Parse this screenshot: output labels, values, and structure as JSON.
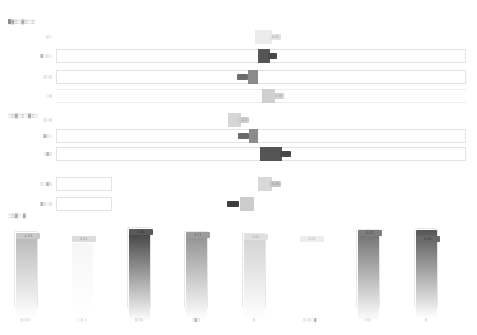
{
  "sections": [
    {
      "id": "section-1",
      "title": "█▓▒░▓▒░▒",
      "x": 8,
      "y": 19
    },
    {
      "id": "section-2",
      "title": "░▒▓░▒░▓▒░",
      "x": 8,
      "y": 113
    },
    {
      "id": "section-3",
      "title": "░▒▓░ ▓",
      "x": 8,
      "y": 213
    }
  ],
  "slider_rows": [
    {
      "label": "▒░",
      "value": "0.05",
      "track": "none",
      "handle_left": 255,
      "handle_width": 17,
      "handle_color": "#ececec",
      "badge_text_color": "#9a9a9a",
      "badge_bg": "#e4e4e4",
      "badge_side": "right",
      "y": 30
    },
    {
      "label": "▓░▒░",
      "value": "0.3",
      "track": "bordered",
      "handle_left": 258,
      "handle_width": 12,
      "handle_color": "#555555",
      "badge_text_color": "#3b3b3b",
      "badge_bg": "#4b4b4b",
      "badge_side": "right",
      "y": 49
    },
    {
      "label": "▒░▒",
      "value": "-0.1",
      "track": "bordered",
      "handle_left": 248,
      "handle_width": 10,
      "handle_color": "#8a8a8a",
      "badge_text_color": "#5d5d5d",
      "badge_bg": "#6f6f6f",
      "badge_side": "left",
      "y": 70
    },
    {
      "label": "░▒",
      "value": "0.08",
      "track": "hairline",
      "handle_left": 262,
      "handle_width": 13,
      "handle_color": "#cfcfcf",
      "badge_text_color": "#a6a6a6",
      "badge_bg": "#d4d4d4",
      "badge_side": "right",
      "y": 89
    },
    {
      "label": "▒░▒",
      "value": "-0.1",
      "track": "none",
      "handle_left": 228,
      "handle_width": 13,
      "handle_color": "#d6d6d6",
      "badge_text_color": "#9c9c9c",
      "badge_bg": "#cdcdcd",
      "badge_side": "right",
      "y": 113
    },
    {
      "label": "▓▒░",
      "value": "-0.2",
      "track": "bordered",
      "handle_left": 249,
      "handle_width": 9,
      "handle_color": "#8c8c8c",
      "badge_text_color": "#5a5a5a",
      "badge_bg": "#6c6c6c",
      "badge_side": "left",
      "y": 129
    },
    {
      "label": "░▓▒",
      "value": "1.03",
      "track": "bordered",
      "handle_left": 260,
      "handle_width": 22,
      "handle_color": "#545454",
      "badge_text_color": "#3a3a3a",
      "badge_bg": "#4a4a4a",
      "badge_side": "right",
      "y": 147
    },
    {
      "label": "▒░▓▒",
      "value": "0.03",
      "track": "short",
      "handle_left": 258,
      "handle_width": 14,
      "handle_color": "#d9d9d9",
      "badge_text_color": "#8f8f8f",
      "badge_bg": "#c9c9c9",
      "badge_side": "right",
      "y": 177
    },
    {
      "label": "▓▒░▒",
      "value": "-0.05",
      "track": "short",
      "handle_left": 240,
      "handle_width": 14,
      "handle_color": "#cccccc",
      "badge_text_color": "#2f2f2f",
      "badge_bg": "#3f3f3f",
      "badge_side": "left",
      "y": 197
    }
  ],
  "bars": [
    {
      "label": "▒░▒░",
      "value": "-0.03",
      "x": 14,
      "width": 24,
      "height": 84,
      "top": 231,
      "badge_top": 233,
      "fill_top": "#b6b6b6",
      "fill_bottom": "#ffffff",
      "badge_bg": "#c9c9c9",
      "badge_color": "#7e7e7e",
      "outline": true
    },
    {
      "label": "░ ▒ ░",
      "value": "0.01",
      "x": 70,
      "width": 24,
      "height": 74,
      "top": 241,
      "badge_top": 236,
      "fill_top": "#f6f6f6",
      "fill_bottom": "#ffffff",
      "badge_bg": "#dddddd",
      "badge_color": "#8d8d8d",
      "outline": false
    },
    {
      "label": "▒░▒",
      "value": "0.36",
      "x": 127,
      "width": 24,
      "height": 92,
      "top": 227,
      "badge_top": 229,
      "fill_top": "#3d3d3d",
      "fill_bottom": "#ffffff",
      "badge_bg": "#5a5a5a",
      "badge_color": "#2c2c2c",
      "outline": true
    },
    {
      "label": "░▓▒",
      "value": "0.17",
      "x": 184,
      "width": 24,
      "height": 86,
      "top": 231,
      "badge_top": 232,
      "fill_top": "#8f8f8f",
      "fill_bottom": "#ffffff",
      "badge_bg": "#9d9d9d",
      "badge_color": "#5c5c5c",
      "outline": true
    },
    {
      "label": "▒",
      "value": "0.05",
      "x": 242,
      "width": 24,
      "height": 84,
      "top": 233,
      "badge_top": 234,
      "fill_top": "#d2d2d2",
      "fill_bottom": "#ffffff",
      "badge_bg": "#e0e0e0",
      "badge_color": "#9e9e9e",
      "outline": true
    },
    {
      "label": "▒░▒░▓",
      "value": "0.03",
      "x": 298,
      "width": 24,
      "height": 0,
      "top": 236,
      "badge_top": 236,
      "fill_top": "#ffffff",
      "fill_bottom": "#ffffff",
      "badge_bg": "#ededed",
      "badge_color": "#b3b3b3",
      "outline": false
    },
    {
      "label": "░▒░",
      "value": "0.22",
      "x": 356,
      "width": 24,
      "height": 90,
      "top": 229,
      "badge_top": 230,
      "fill_top": "#6e6e6e",
      "fill_bottom": "#ffffff",
      "badge_bg": "#7d7d7d",
      "badge_color": "#3f3f3f",
      "outline": true
    },
    {
      "label": "▒",
      "value": "0.28",
      "x": 414,
      "width": 24,
      "height": 88,
      "top": 228,
      "badge_top": 236,
      "fill_top": "#555555",
      "fill_bottom": "#ffffff",
      "badge_bg": "#6a6a6a",
      "badge_color": "#333333",
      "outline": true
    }
  ],
  "layout": {
    "label_right_edge": 52,
    "track_left": 56,
    "track_right": 466,
    "short_track_left": 56,
    "short_track_width": 56,
    "row_height": 14,
    "bar_label_y": 318
  },
  "colors": {
    "page_background": "#ffffff",
    "track_border": "#e3e3e3",
    "hairline": "#ededed",
    "text_muted": "#9b9b9b"
  }
}
